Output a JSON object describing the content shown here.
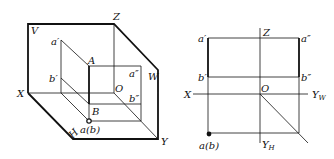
{
  "left_diagram": {
    "title": "3D projection box",
    "labels": {
      "V": "V",
      "Z": "Z",
      "W": "W",
      "X": "X",
      "Y": "Y",
      "H": "H",
      "O": "O",
      "A": "A",
      "B": "B",
      "a_prime": "a′",
      "b_prime": "b′",
      "a_dprime": "a″",
      "b_dprime": "b″",
      "ab": "a(b)"
    }
  },
  "right_diagram": {
    "title": "Orthographic projection",
    "labels": {
      "Z": "Z",
      "X": "X",
      "O": "O",
      "Y": "Y",
      "YW_sub": "W",
      "YH_sub": "H",
      "a_prime": "a′",
      "b_prime": "b′",
      "a_dprime": "a″",
      "b_dprime": "b″",
      "ab": "a(b)"
    }
  },
  "colors": {
    "line": "#111111",
    "background": "#ffffff"
  }
}
